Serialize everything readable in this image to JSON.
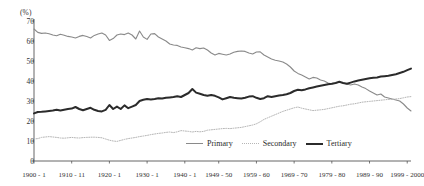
{
  "chart_data": {
    "type": "line",
    "title": "",
    "xlabel": "",
    "ylabel": "(%)",
    "ylim": [
      0,
      70
    ],
    "ytick_values": [
      0,
      10,
      20,
      30,
      40,
      50,
      60,
      70
    ],
    "grid": false,
    "legend_position": "bottom-right",
    "xtick_labels": [
      "1900 - 1",
      "1910 - 11",
      "1920 - 1",
      "1930 - 1",
      "1940 - 1",
      "1949 - 50",
      "1959 - 60",
      "1969 - 70",
      "1979 - 80",
      "1989 - 90",
      "1999 - 2000"
    ],
    "xtick_years": [
      1900,
      1910,
      1920,
      1930,
      1940,
      1949,
      1959,
      1969,
      1979,
      1989,
      1999
    ],
    "x_start": 1900,
    "x_end": 2000,
    "series": [
      {
        "name": "Primary",
        "color": "#8a8a8a",
        "style": "solid",
        "width": 1.1,
        "x": [
          1900,
          1901,
          1902,
          1903,
          1904,
          1905,
          1906,
          1907,
          1908,
          1909,
          1910,
          1911,
          1912,
          1913,
          1914,
          1915,
          1916,
          1917,
          1918,
          1919,
          1920,
          1921,
          1922,
          1923,
          1924,
          1925,
          1926,
          1927,
          1928,
          1929,
          1930,
          1931,
          1932,
          1933,
          1934,
          1935,
          1936,
          1937,
          1938,
          1939,
          1940,
          1941,
          1942,
          1943,
          1944,
          1945,
          1946,
          1947,
          1948,
          1949,
          1950,
          1951,
          1952,
          1953,
          1954,
          1955,
          1956,
          1957,
          1958,
          1959,
          1960,
          1961,
          1962,
          1963,
          1964,
          1965,
          1966,
          1967,
          1968,
          1969,
          1970,
          1971,
          1972,
          1973,
          1974,
          1975,
          1976,
          1977,
          1978,
          1979,
          1980,
          1981,
          1982,
          1983,
          1984,
          1985,
          1986,
          1987,
          1988,
          1989,
          1990,
          1991,
          1992,
          1993,
          1994,
          1995,
          1996,
          1997,
          1998,
          1999,
          2000
        ],
        "values": [
          66.0,
          64.3,
          63.8,
          64.0,
          63.6,
          63.0,
          62.6,
          63.4,
          62.9,
          62.3,
          62.0,
          61.5,
          62.3,
          62.8,
          62.2,
          61.5,
          62.8,
          63.5,
          64.0,
          63.0,
          60.3,
          61.2,
          63.0,
          63.5,
          63.2,
          64.0,
          63.0,
          61.0,
          65.0,
          62.0,
          60.8,
          63.5,
          63.7,
          62.0,
          61.0,
          60.0,
          58.5,
          58.0,
          57.8,
          57.0,
          56.6,
          56.2,
          55.5,
          56.6,
          56.2,
          56.5,
          55.5,
          54.0,
          53.0,
          53.8,
          53.4,
          53.0,
          53.5,
          54.4,
          54.8,
          55.0,
          54.8,
          54.0,
          53.5,
          54.5,
          54.6,
          53.0,
          52.0,
          51.0,
          50.4,
          50.0,
          49.5,
          48.5,
          47.0,
          45.0,
          43.8,
          43.0,
          42.0,
          41.0,
          41.8,
          41.5,
          40.5,
          40.0,
          39.0,
          38.5,
          39.0,
          39.5,
          39.0,
          38.5,
          38.0,
          38.5,
          38.0,
          37.0,
          36.2,
          35.0,
          34.0,
          33.0,
          33.5,
          32.0,
          31.5,
          31.0,
          30.5,
          30.0,
          28.5,
          26.5,
          25.0
        ]
      },
      {
        "name": "Secondary",
        "color": "#b6b6b6",
        "style": "dotted",
        "width": 1.0,
        "x": [
          1900,
          1901,
          1902,
          1903,
          1904,
          1905,
          1906,
          1907,
          1908,
          1909,
          1910,
          1911,
          1912,
          1913,
          1914,
          1915,
          1916,
          1917,
          1918,
          1919,
          1920,
          1921,
          1922,
          1923,
          1924,
          1925,
          1926,
          1927,
          1928,
          1929,
          1930,
          1931,
          1932,
          1933,
          1934,
          1935,
          1936,
          1937,
          1938,
          1939,
          1940,
          1941,
          1942,
          1943,
          1944,
          1945,
          1946,
          1947,
          1948,
          1949,
          1950,
          1951,
          1952,
          1953,
          1954,
          1955,
          1956,
          1957,
          1958,
          1959,
          1960,
          1961,
          1962,
          1963,
          1964,
          1965,
          1966,
          1967,
          1968,
          1969,
          1970,
          1971,
          1972,
          1973,
          1974,
          1975,
          1976,
          1977,
          1978,
          1979,
          1980,
          1981,
          1982,
          1983,
          1984,
          1985,
          1986,
          1987,
          1988,
          1989,
          1990,
          1991,
          1992,
          1993,
          1994,
          1995,
          1996,
          1997,
          1998,
          1999,
          2000
        ],
        "values": [
          11.0,
          11.2,
          11.8,
          12.0,
          12.2,
          12.0,
          11.8,
          11.5,
          11.4,
          11.6,
          11.8,
          11.6,
          11.5,
          11.7,
          11.8,
          11.9,
          11.9,
          11.8,
          11.6,
          11.0,
          10.4,
          10.0,
          9.8,
          10.3,
          10.8,
          11.2,
          11.5,
          11.8,
          12.2,
          12.5,
          12.8,
          13.2,
          13.5,
          13.8,
          14.0,
          14.3,
          14.5,
          14.2,
          14.6,
          15.2,
          15.0,
          14.8,
          14.5,
          14.8,
          14.6,
          14.8,
          15.4,
          15.6,
          15.8,
          16.0,
          16.2,
          16.3,
          16.2,
          16.4,
          16.6,
          16.8,
          17.2,
          17.6,
          18.0,
          18.6,
          19.6,
          20.8,
          21.6,
          22.4,
          23.2,
          24.0,
          24.8,
          25.4,
          26.0,
          26.6,
          27.0,
          26.4,
          26.0,
          25.6,
          25.2,
          25.4,
          25.6,
          25.8,
          26.2,
          26.6,
          27.0,
          27.4,
          27.6,
          28.0,
          28.4,
          28.6,
          29.0,
          29.4,
          29.6,
          29.8,
          30.0,
          30.2,
          30.4,
          30.6,
          30.8,
          30.8,
          31.0,
          31.2,
          31.6,
          32.0,
          32.2
        ]
      },
      {
        "name": "Tertiary",
        "color": "#2b2b2b",
        "style": "solid",
        "width": 2.0,
        "x": [
          1900,
          1901,
          1902,
          1903,
          1904,
          1905,
          1906,
          1907,
          1908,
          1909,
          1910,
          1911,
          1912,
          1913,
          1914,
          1915,
          1916,
          1917,
          1918,
          1919,
          1920,
          1921,
          1922,
          1923,
          1924,
          1925,
          1926,
          1927,
          1928,
          1929,
          1930,
          1931,
          1932,
          1933,
          1934,
          1935,
          1936,
          1937,
          1938,
          1939,
          1940,
          1941,
          1942,
          1943,
          1944,
          1945,
          1946,
          1947,
          1948,
          1949,
          1950,
          1951,
          1952,
          1953,
          1954,
          1955,
          1956,
          1957,
          1958,
          1959,
          1960,
          1961,
          1962,
          1963,
          1964,
          1965,
          1966,
          1967,
          1968,
          1969,
          1970,
          1971,
          1972,
          1973,
          1974,
          1975,
          1976,
          1977,
          1978,
          1979,
          1980,
          1981,
          1982,
          1983,
          1984,
          1985,
          1986,
          1987,
          1988,
          1989,
          1990,
          1991,
          1992,
          1993,
          1994,
          1995,
          1996,
          1997,
          1998,
          1999,
          2000
        ],
        "values": [
          23.8,
          24.5,
          24.6,
          24.8,
          25.0,
          25.2,
          25.6,
          25.2,
          25.6,
          26.0,
          26.2,
          27.0,
          26.0,
          25.4,
          26.0,
          26.6,
          25.6,
          25.0,
          24.8,
          25.6,
          28.0,
          26.0,
          27.2,
          26.0,
          27.8,
          26.4,
          27.2,
          28.0,
          30.0,
          30.6,
          31.0,
          30.8,
          31.0,
          31.4,
          31.2,
          31.6,
          31.8,
          32.0,
          32.4,
          32.0,
          33.0,
          34.0,
          36.0,
          34.2,
          33.6,
          33.0,
          32.6,
          33.0,
          32.6,
          31.8,
          30.8,
          31.4,
          32.0,
          31.6,
          31.4,
          31.2,
          31.6,
          32.2,
          32.4,
          31.6,
          31.0,
          31.4,
          32.4,
          32.0,
          32.4,
          32.8,
          33.0,
          33.4,
          34.0,
          35.0,
          35.6,
          35.4,
          35.8,
          36.4,
          36.8,
          37.2,
          37.6,
          38.0,
          38.4,
          38.6,
          39.0,
          39.6,
          39.0,
          38.6,
          39.2,
          39.8,
          40.2,
          40.6,
          41.0,
          41.4,
          41.6,
          41.8,
          42.2,
          42.4,
          42.6,
          43.0,
          43.4,
          44.0,
          44.6,
          45.4,
          46.2
        ]
      }
    ]
  },
  "legend": {
    "items": [
      {
        "label": "Primary"
      },
      {
        "label": "Secondary"
      },
      {
        "label": "Tertiary"
      }
    ]
  }
}
